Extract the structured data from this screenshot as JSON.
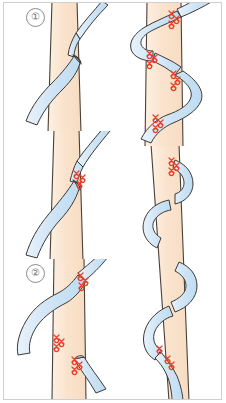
{
  "figure": {
    "panel_count": 5,
    "background_color": "#ffffff",
    "frame_color": "#cfcfcf"
  },
  "colors": {
    "artery_fill": "#fae3cd",
    "artery_fill_light": "#fdeedd",
    "artery_outline": "#4a4038",
    "vein_fill": "#cfe4f5",
    "vein_fill_light": "#e4f0fa",
    "vein_outline": "#3d3a36",
    "suture_red": "#e8402a",
    "suture_red_dark": "#c9301d",
    "label_text": "#6f6f6f",
    "label_border": "#8d8d8d"
  },
  "panels": [
    {
      "id": "panel-1",
      "number": "1",
      "label": "①",
      "description": "Vein crosses in front of the artery, no sutures placed",
      "suture_groups": 0
    },
    {
      "id": "panel-2",
      "number": "2",
      "label": "②",
      "description": "Single suture group at upper crossing point of vein and artery",
      "suture_groups": 1
    },
    {
      "id": "panel-3",
      "number": "3",
      "label": "③",
      "description": "Three suture groups along S-shaped vein crossing the artery",
      "suture_groups": 3
    },
    {
      "id": "panel-4",
      "number": "4",
      "label": "④",
      "description": "Double S-shaped vein with four suture groups along the artery",
      "suture_groups": 4
    },
    {
      "id": "panel-5",
      "number": "5",
      "label": "⑤",
      "description": "Long artery segment with multiple vein loops and two suture groups",
      "suture_groups": 2
    }
  ]
}
